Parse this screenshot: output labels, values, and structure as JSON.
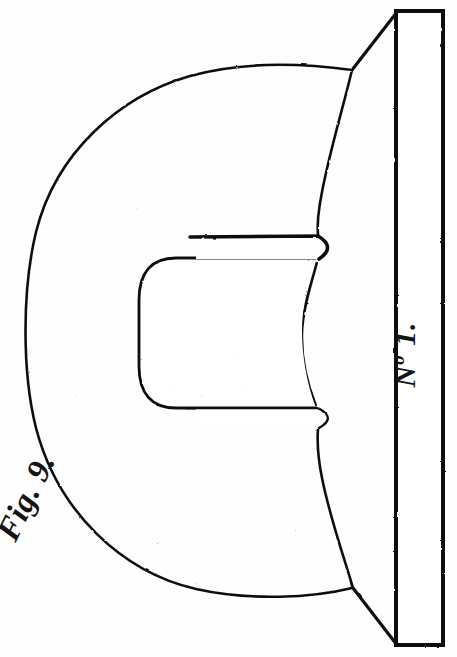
{
  "plate": {
    "width": 457,
    "height": 657,
    "background_color": "#fefefe",
    "ink_color": "#111111",
    "medium": "stipple-engraving"
  },
  "labels": {
    "figure": {
      "text": "Fig. 9.",
      "rotation_deg": -64,
      "style": "italic-serif"
    },
    "number": {
      "prefix": "N",
      "superscript": "o",
      "value": "1.",
      "text": "No 1.",
      "rotation_deg": -90,
      "style": "italic-serif"
    }
  },
  "figure": {
    "name": "sectional-view-of-grooved-ring-block",
    "outer_body": {
      "shape": "rounded-horseshoe-profile",
      "shading": "stipple",
      "stipple_density": "medium"
    },
    "inner_cavity": {
      "shape": "rounded-rectangular-channel",
      "shading": "stipple",
      "stipple_density": "heavy-lower-half"
    },
    "grooves": [
      {
        "name": "upper-groove",
        "y_top": 236,
        "y_bottom": 259
      },
      {
        "name": "lower-groove",
        "y_top": 408,
        "y_bottom": 427
      }
    ],
    "vertical_bar": {
      "name": "no-1-bar",
      "x": 396,
      "y": 11,
      "width": 47,
      "height": 634,
      "fill": "#ffffff",
      "stroke": "#111111"
    },
    "connectors": [
      {
        "name": "top-diagonal",
        "from": [
          355,
          72
        ],
        "to": [
          396,
          11
        ]
      },
      {
        "name": "bottom-diagonal",
        "from": [
          353,
          588
        ],
        "to": [
          396,
          645
        ]
      }
    ]
  }
}
